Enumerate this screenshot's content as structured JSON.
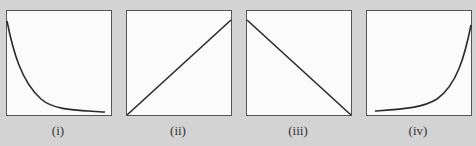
{
  "figure": {
    "background_color": "#d3d3d3",
    "panel_color": "#fbfbfb",
    "stroke_color": "#2a2a2a",
    "panels": [
      {
        "label": "(i)",
        "shape": "decaying-curve",
        "description": "Curve decreasing steeply then flattening (hyperbolic / exponential decay)"
      },
      {
        "label": "(ii)",
        "shape": "rising-line",
        "description": "Straight line rising from origin (direct proportion)"
      },
      {
        "label": "(iii)",
        "shape": "falling-line",
        "description": "Straight line falling from top-left to bottom-right"
      },
      {
        "label": "(iv)",
        "shape": "growing-curve",
        "description": "Curve flat then rising steeply (exponential growth)"
      }
    ]
  }
}
